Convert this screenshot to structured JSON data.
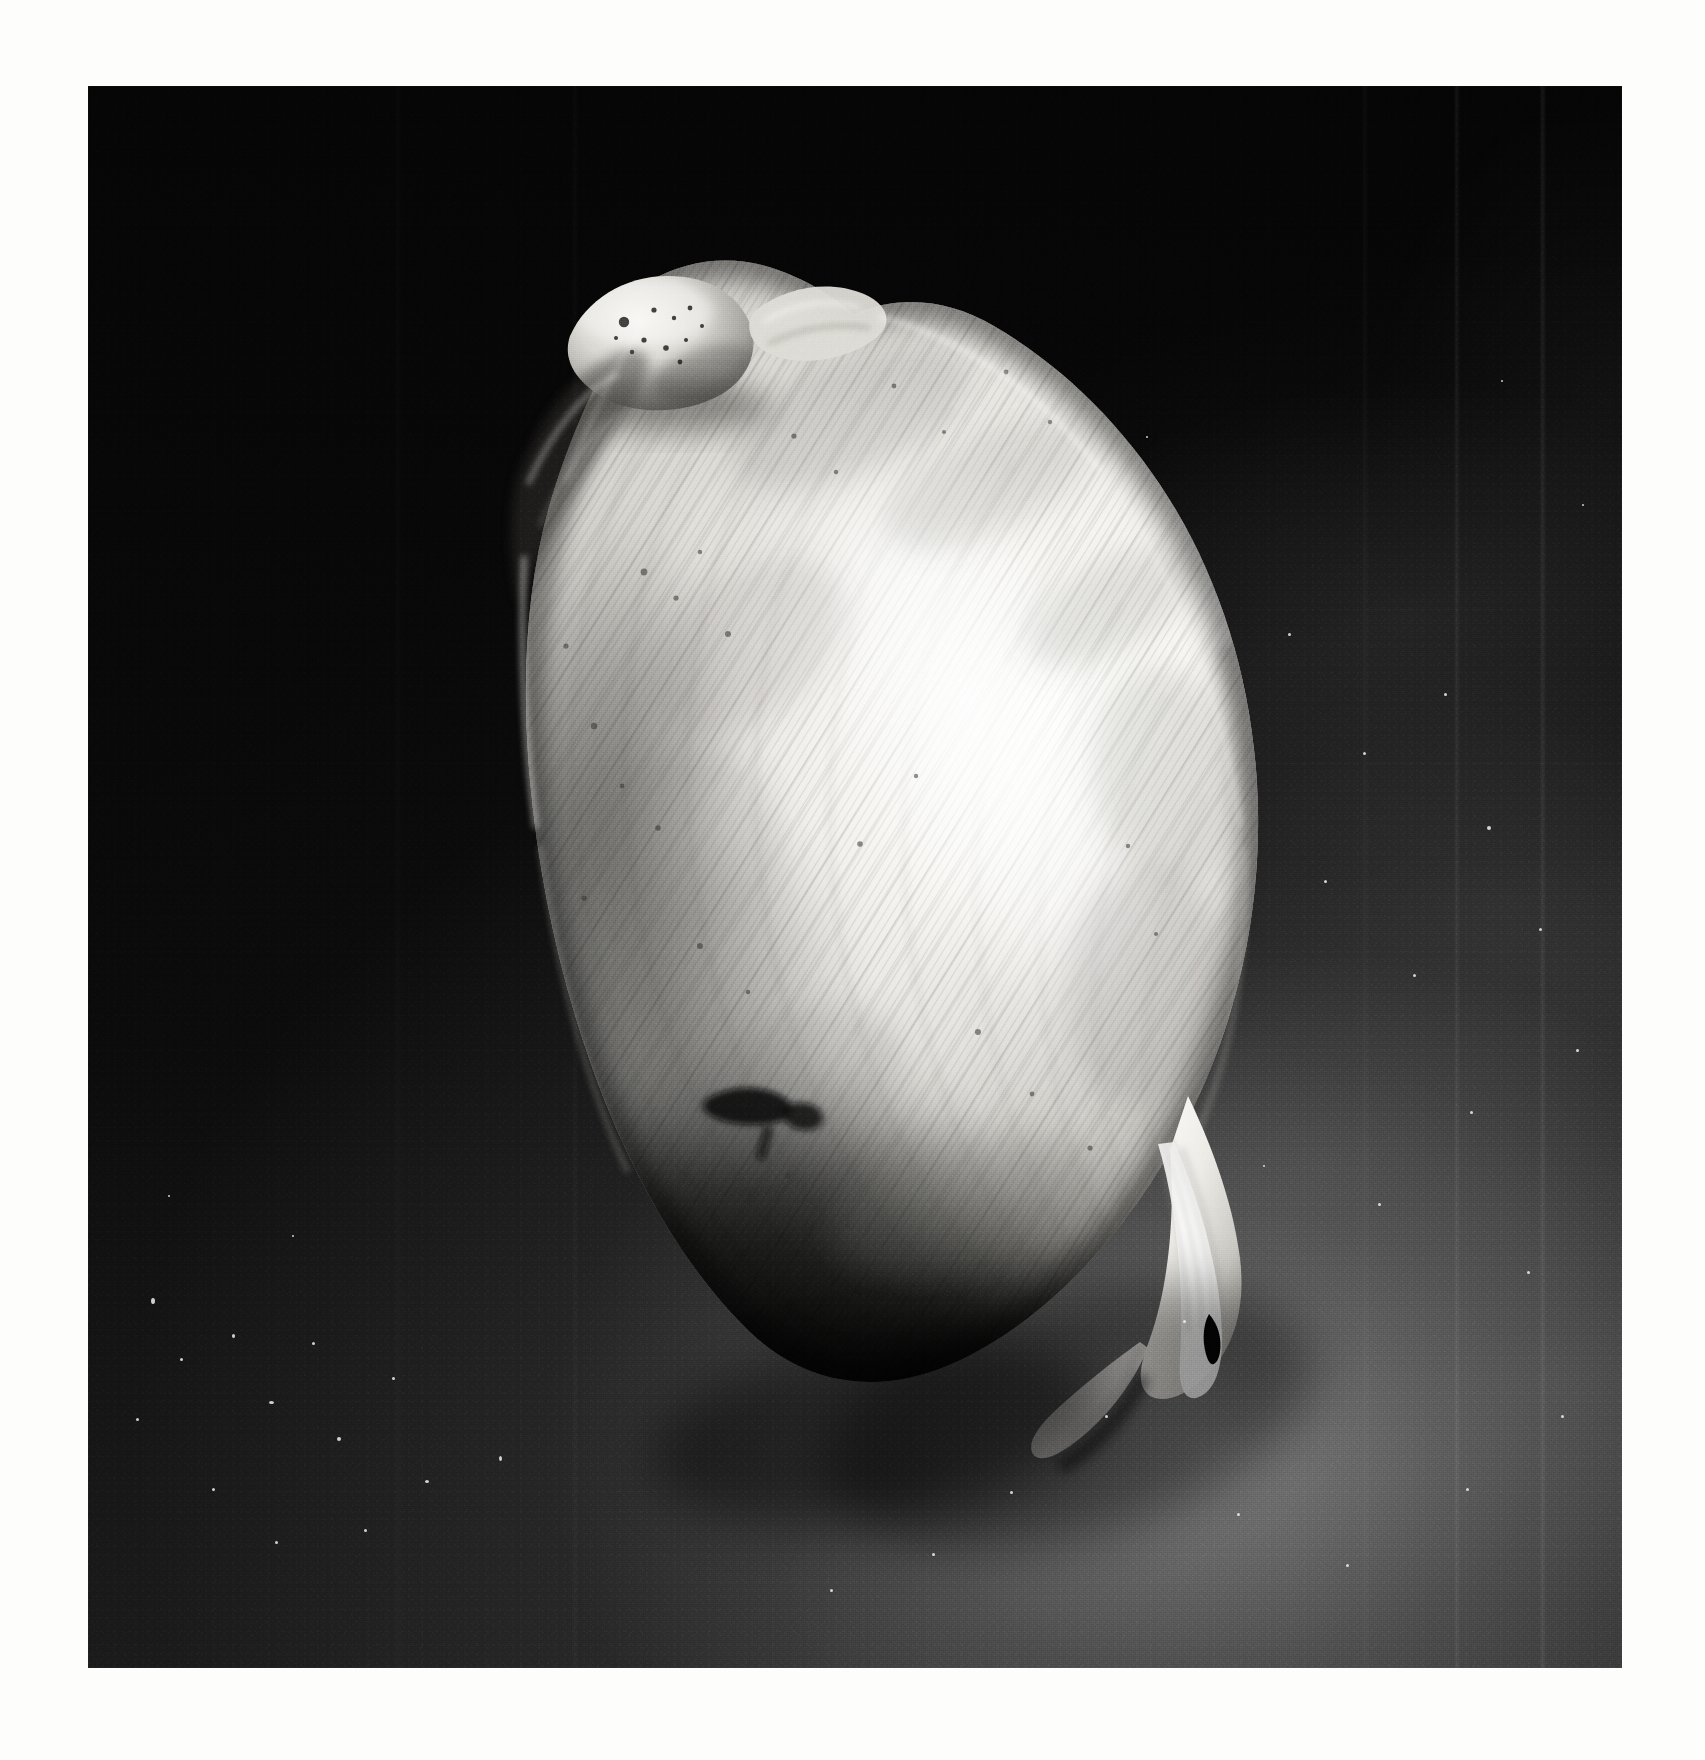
{
  "image": {
    "kind": "photograph",
    "medium": "black-and-white photographic print",
    "subject": "bivalve clam shell",
    "orientation": "portrait",
    "caption": "Black and white photograph of a single smooth bivalve clam shell, umbo at upper left, tilted diagonally against a dark backdrop",
    "alt_text": "A pale ovate clam shell with fine concentric growth lines lit from the upper right, set against a black to dark grey gradient background, printed with a white paper margin."
  },
  "print": {
    "paper_color": "#fdfdfc",
    "margin_left_px": 88,
    "margin_top_px": 86,
    "photo_width_px": 1534,
    "photo_height_px": 1582
  },
  "palette": {
    "paper_white": "#fdfdfc",
    "background_black": "#060606",
    "background_dark_grey": "#1b1b1b",
    "background_mid_grey": "#6f6f6f",
    "background_light_grey": "#8d8d8d",
    "shell_highlight": "#fbfbf8",
    "shell_light": "#e8e7e2",
    "shell_mid": "#b9b8b2",
    "shell_shadow": "#6a6864",
    "shell_deep_shadow": "#1d1c1a",
    "shell_flange_white": "#f7f6f2"
  },
  "subject_regions": [
    {
      "name": "umbo",
      "label": "umbo / beak",
      "note": "rounded knob at the top of the shell with dark pits"
    },
    {
      "name": "dorsal-margin",
      "label": "dorsal margin",
      "note": "upper right ridge descending from the umbo"
    },
    {
      "name": "lunule",
      "label": "lunule",
      "note": "depressed area just left of the umbo"
    },
    {
      "name": "anterior-margin",
      "label": "anterior margin",
      "note": "concave left waist of the shell"
    },
    {
      "name": "growth-lines",
      "label": "concentric growth lines",
      "note": "fine striations following the shell outline"
    },
    {
      "name": "specular-highlight",
      "label": "specular highlight",
      "note": "bright band across the right centre of the shell"
    },
    {
      "name": "ventral-margin",
      "label": "ventral margin",
      "note": "dark shadowed lower edge"
    },
    {
      "name": "posterior-tip",
      "label": "posterior tip",
      "note": "bright pointed flange at the lower right"
    },
    {
      "name": "dark-blotch",
      "label": "dark surface blotch",
      "note": "small black stain on the lower left of the shell"
    }
  ],
  "background_features": [
    {
      "name": "gradient-light-pool",
      "label": "lit backdrop pool",
      "note": "grey glow filling the lower right corner"
    },
    {
      "name": "vertical-scratches",
      "label": "emulsion scratches",
      "note": "faint vertical lines in the dark right field"
    },
    {
      "name": "dust-specks",
      "label": "dust specks",
      "note": "scattered white pinpoints, densest at lower left"
    }
  ]
}
